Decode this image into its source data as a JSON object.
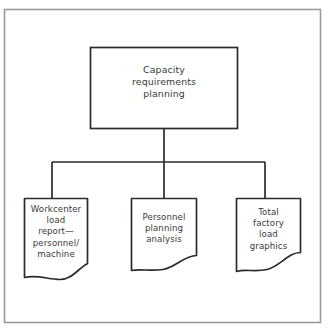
{
  "diagram": {
    "type": "hierarchy-flowchart",
    "orientation": "top-down",
    "background_color": "#ffffff",
    "line_color": "#2b2b2b",
    "text_color": "#3a3a3a",
    "frame_color": "#9a9a9a",
    "frame": {
      "name": "outer-border",
      "shape": "rectangle"
    },
    "root": {
      "id": "capacity-requirements-planning",
      "shape": "rectangle",
      "label": "Capacity\nrequirements\nplanning"
    },
    "children": [
      {
        "id": "workcenter-load-report",
        "shape": "document",
        "label": "Workcenter\nload\nreport—\npersonnel/\nmachine"
      },
      {
        "id": "personnel-planning-analysis",
        "shape": "document",
        "label": "Personnel\nplanning\nanalysis"
      },
      {
        "id": "total-factory-load-graphics",
        "shape": "document",
        "label": "Total\nfactory\nload\ngraphics"
      }
    ],
    "connectors": [
      {
        "name": "root-to-bus",
        "from": "capacity-requirements-planning",
        "to": "distribution-bus"
      },
      {
        "name": "bus-to-workcenter-load-report",
        "from": "distribution-bus",
        "to": "workcenter-load-report"
      },
      {
        "name": "bus-to-personnel-planning-analysis",
        "from": "distribution-bus",
        "to": "personnel-planning-analysis"
      },
      {
        "name": "bus-to-total-factory-load-graphics",
        "from": "distribution-bus",
        "to": "total-factory-load-graphics"
      }
    ]
  }
}
